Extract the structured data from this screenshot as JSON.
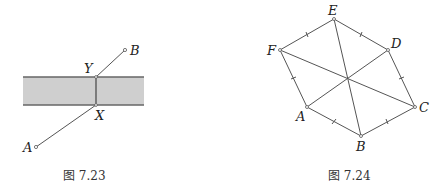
{
  "figures": [
    {
      "id": "fig-7-23",
      "caption": "图 7.23",
      "strip": {
        "x1": 23,
        "x2": 144,
        "y_top": 77,
        "y_bottom": 105,
        "fill": "#cfcfcf"
      },
      "points": {
        "A": {
          "label": "A",
          "x": 36,
          "y": 147
        },
        "X": {
          "label": "X",
          "x": 96,
          "y": 105
        },
        "Y": {
          "label": "Y",
          "x": 96,
          "y": 77
        },
        "B": {
          "label": "B",
          "x": 125,
          "y": 50
        }
      }
    },
    {
      "id": "fig-7-24",
      "caption": "图 7.24",
      "points": {
        "A": {
          "label": "A",
          "x": 307,
          "y": 107
        },
        "B": {
          "label": "B",
          "x": 361,
          "y": 136
        },
        "C": {
          "label": "C",
          "x": 415,
          "y": 107
        },
        "D": {
          "label": "D",
          "x": 388,
          "y": 50
        },
        "E": {
          "label": "E",
          "x": 334,
          "y": 19
        },
        "F": {
          "label": "F",
          "x": 280,
          "y": 50
        }
      },
      "center": {
        "x": 348,
        "y": 77
      }
    }
  ]
}
